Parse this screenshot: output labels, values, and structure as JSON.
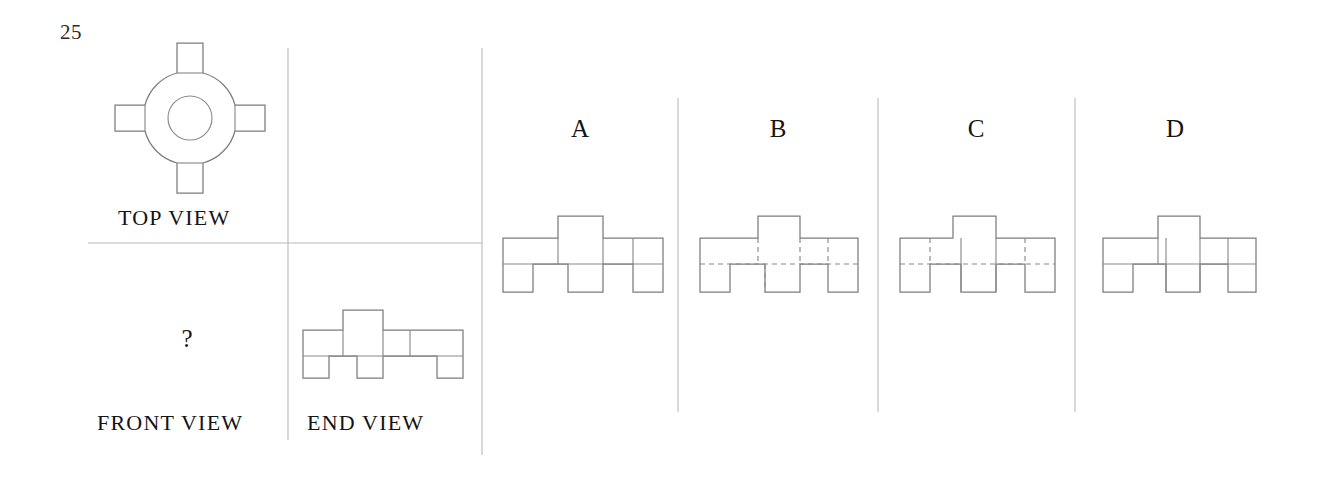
{
  "question": {
    "number": "25",
    "type": "orthographic-projection-multiple-choice",
    "missing_view_marker": "?"
  },
  "labels": {
    "top_view": "TOP VIEW",
    "front_view": "FRONT VIEW",
    "end_view": "END VIEW"
  },
  "options": [
    {
      "letter": "A",
      "line_style": "solid",
      "center_block": "short"
    },
    {
      "letter": "B",
      "line_style": "dashed",
      "center_block": "short"
    },
    {
      "letter": "C",
      "line_style": "mixed",
      "center_block": "tall"
    },
    {
      "letter": "D",
      "line_style": "solid",
      "center_block": "tall"
    }
  ],
  "colors": {
    "background": "#ffffff",
    "ink": "#141414",
    "line": "#8a8a8a",
    "rule": "#b4b4b4"
  },
  "drawing": {
    "top_view": {
      "center_x": 190,
      "center_y": 118,
      "inner_radius": 22,
      "hub_radius": 45,
      "arm_half_width": 13,
      "arm_length": 78,
      "pad_half_width": 20,
      "pad_length": 30
    },
    "end_view": {
      "width": 160,
      "left": 303,
      "top": 310,
      "band_height": 26,
      "top_tab_width": 40,
      "top_tab_height": 20,
      "foot_height": 26
    }
  },
  "layout": {
    "dividers_x": [
      288,
      482,
      678,
      878,
      1075
    ],
    "divider_top": 48,
    "divider_bottom": 455,
    "short_divider_bottom": 440,
    "horizontal_rule_y": 243,
    "horizontal_rule_x1": 88,
    "horizontal_rule_x2": 482
  }
}
